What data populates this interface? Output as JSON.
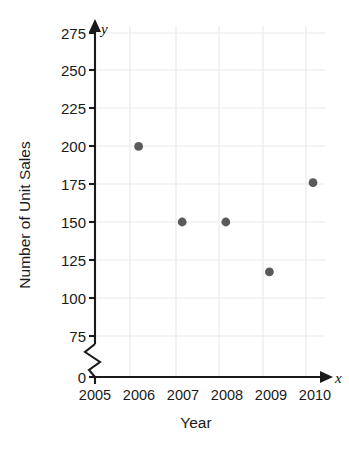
{
  "chart_data": {
    "type": "scatter",
    "title": "",
    "xlabel": "Year",
    "ylabel": "Number of Unit Sales",
    "x_axis_symbol": "x",
    "y_axis_symbol": "y",
    "categories": [
      "2005",
      "2006",
      "2007",
      "2008",
      "2009",
      "2010"
    ],
    "x_tick_labels": [
      "2005",
      "2006",
      "2007",
      "2008",
      "2009",
      "2010"
    ],
    "y_tick_labels": [
      "0",
      "75",
      "100",
      "125",
      "150",
      "175",
      "200",
      "225",
      "250",
      "275"
    ],
    "ylim": [
      0,
      275
    ],
    "xlim": [
      2005,
      2010
    ],
    "y_axis_break": true,
    "y_axis_break_between": [
      0,
      75
    ],
    "grid": true,
    "legend": false,
    "points": [
      {
        "x": "2006",
        "y": 200
      },
      {
        "x": "2007",
        "y": 150
      },
      {
        "x": "2008",
        "y": 150
      },
      {
        "x": "2009",
        "y": 117
      },
      {
        "x": "2010",
        "y": 176
      }
    ],
    "series": [
      {
        "name": "Unit Sales",
        "x": [
          2006,
          2007,
          2008,
          2009,
          2010
        ],
        "values": [
          200,
          150,
          150,
          117,
          176
        ]
      }
    ],
    "marker_color": "#5a5a5a",
    "grid_color": "#efeff1",
    "axis_color": "#1a1a1a"
  }
}
